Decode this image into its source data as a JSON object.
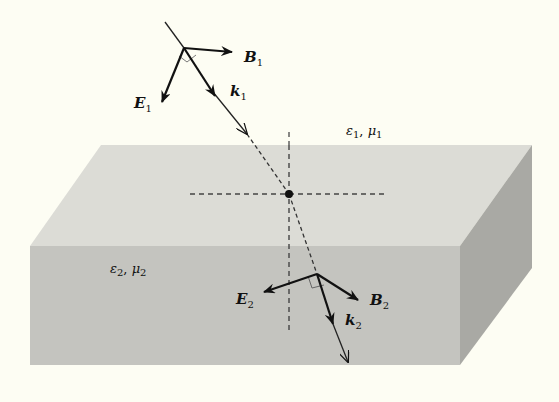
{
  "figure": {
    "type": "refraction-diagram",
    "colors": {
      "background": "#fdfdf3",
      "top_face": "#dcdcd6",
      "front_face": "#c4c4bf",
      "side_face": "#a9a9a4",
      "ink": "#111111"
    },
    "medium1": {
      "eps": "ε",
      "eps_sub": "1",
      "sep": ", ",
      "mu": "μ",
      "mu_sub": "1"
    },
    "medium2": {
      "eps": "ε",
      "eps_sub": "2",
      "sep": ", ",
      "mu": "μ",
      "mu_sub": "2"
    },
    "incident": {
      "E": {
        "sym": "E",
        "sub": "1"
      },
      "B": {
        "sym": "B",
        "sub": "1"
      },
      "k": {
        "sym": "k",
        "sub": "1"
      }
    },
    "transmitted": {
      "E": {
        "sym": "E",
        "sub": "2"
      },
      "B": {
        "sym": "B",
        "sub": "2"
      },
      "k": {
        "sym": "k",
        "sub": "2"
      }
    }
  }
}
